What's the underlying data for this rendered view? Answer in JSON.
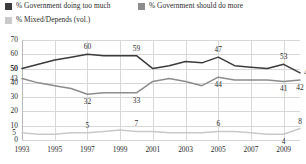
{
  "legend": {
    "items": [
      {
        "label": "% Government doing too much",
        "color": "#3b3b3b",
        "swatch": "legend-swatch-too-much"
      },
      {
        "label": "% Government should do more",
        "color": "#8c8c8c",
        "swatch": "legend-swatch-do-more"
      },
      {
        "label": "% Mixed/Depends (vol.)",
        "color": "#c9c9c9",
        "swatch": "legend-swatch-mixed"
      }
    ]
  },
  "axes": {
    "y_ticks": [
      "0",
      "10",
      "20",
      "30",
      "40",
      "50",
      "60",
      "70"
    ],
    "x_ticks": [
      "1993",
      "1995",
      "1997",
      "1999",
      "2001",
      "2003",
      "2005",
      "2007",
      "2009"
    ]
  },
  "chart_data": {
    "type": "line",
    "title": "",
    "xlabel": "",
    "ylabel": "",
    "ylim": [
      0,
      70
    ],
    "xlim": [
      1993,
      2010
    ],
    "grid": true,
    "legend_position": "top",
    "x": [
      1993,
      1994,
      1995,
      1996,
      1997,
      1998,
      1999,
      2000,
      2001,
      2002,
      2003,
      2004,
      2005,
      2006,
      2007,
      2008,
      2009,
      2010
    ],
    "series": [
      {
        "name": "% Government doing too much",
        "color": "#3b3b3b",
        "values": [
          50,
          53,
          56,
          58,
          60,
          59,
          59,
          59,
          50,
          52,
          55,
          54,
          58,
          52,
          51,
          50,
          53,
          47
        ]
      },
      {
        "name": "% Government should do more",
        "color": "#8c8c8c",
        "values": [
          43,
          40,
          38,
          36,
          32,
          33,
          33,
          33,
          41,
          43,
          41,
          38,
          44,
          42,
          42,
          42,
          41,
          42
        ]
      },
      {
        "name": "% Mixed/Depends (vol.)",
        "color": "#c9c9c9",
        "values": [
          5,
          4,
          4,
          5,
          5,
          6,
          7,
          6,
          6,
          5,
          5,
          5,
          6,
          6,
          5,
          4,
          4,
          8
        ]
      }
    ],
    "point_labels": [
      {
        "series": "% Government doing too much",
        "x": 1993,
        "value": "50",
        "pos": "left"
      },
      {
        "series": "% Government doing too much",
        "x": 1997,
        "value": "60",
        "pos": "above"
      },
      {
        "series": "% Government doing too much",
        "x": 2000,
        "value": "59",
        "pos": "above"
      },
      {
        "series": "% Government doing too much",
        "x": 2005,
        "value": "47",
        "pos": "above"
      },
      {
        "series": "% Government doing too much",
        "x": 2009,
        "value": "53",
        "pos": "above"
      },
      {
        "series": "% Government doing too much",
        "x": 2010,
        "value": "47",
        "pos": "right"
      },
      {
        "series": "% Government should do more",
        "x": 1993,
        "value": "43",
        "pos": "left"
      },
      {
        "series": "% Government should do more",
        "x": 1997,
        "value": "32",
        "pos": "below"
      },
      {
        "series": "% Government should do more",
        "x": 2000,
        "value": "33",
        "pos": "below"
      },
      {
        "series": "% Government should do more",
        "x": 2005,
        "value": "44",
        "pos": "below"
      },
      {
        "series": "% Government should do more",
        "x": 2009,
        "value": "41",
        "pos": "below"
      },
      {
        "series": "% Government should do more",
        "x": 2010,
        "value": "42",
        "pos": "below"
      },
      {
        "series": "% Mixed/Depends (vol.)",
        "x": 1993,
        "value": "5",
        "pos": "left"
      },
      {
        "series": "% Mixed/Depends (vol.)",
        "x": 1997,
        "value": "5",
        "pos": "above"
      },
      {
        "series": "% Mixed/Depends (vol.)",
        "x": 2000,
        "value": "7",
        "pos": "above"
      },
      {
        "series": "% Mixed/Depends (vol.)",
        "x": 2005,
        "value": "6",
        "pos": "above"
      },
      {
        "series": "% Mixed/Depends (vol.)",
        "x": 2009,
        "value": "4",
        "pos": "below"
      },
      {
        "series": "% Mixed/Depends (vol.)",
        "x": 2010,
        "value": "8",
        "pos": "above"
      }
    ]
  }
}
